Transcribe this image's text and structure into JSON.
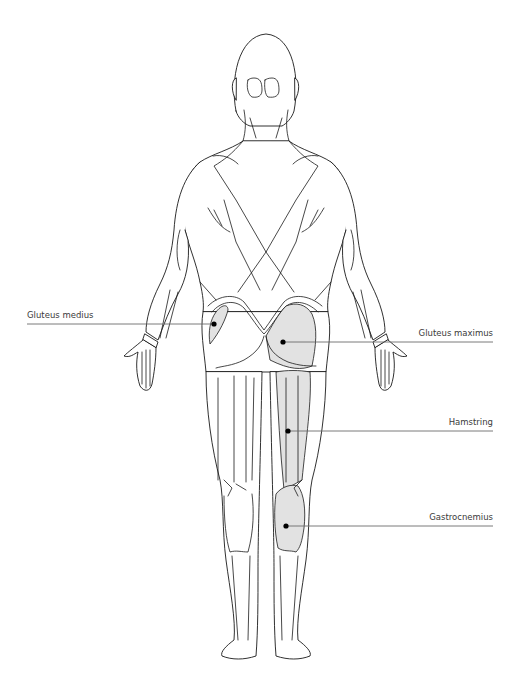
{
  "diagram": {
    "highlight_color": "#e2e2e2",
    "outline_color": "#1a1a1a",
    "leader_color": "#6b6b6b",
    "labels": [
      {
        "id": "gluteus-medius",
        "text": "Gluteus medius",
        "side": "left",
        "line_y": 324,
        "dot": [
          214,
          324
        ]
      },
      {
        "id": "gluteus-maximus",
        "text": "Gluteus maximus",
        "side": "right",
        "line_y": 342,
        "dot": [
          283,
          342
        ]
      },
      {
        "id": "hamstring",
        "text": "Hamstring",
        "side": "right",
        "line_y": 431,
        "dot": [
          288,
          431
        ]
      },
      {
        "id": "gastrocnemius",
        "text": "Gastrocnemius",
        "side": "right",
        "line_y": 526,
        "dot": [
          286,
          526
        ]
      }
    ]
  }
}
